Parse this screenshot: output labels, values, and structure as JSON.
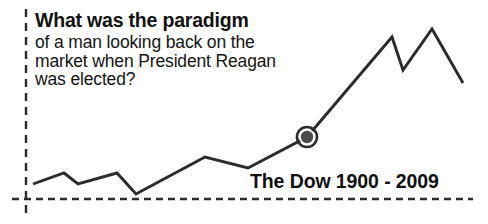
{
  "headline": "What was the paradigm",
  "body_lines": [
    "of a man looking back on the",
    "market when President Reagan",
    "was elected?"
  ],
  "caption": "The Dow 1900 - 2009",
  "colors": {
    "background": "#ffffff",
    "ink": "#2b2b2b",
    "text": "#111111",
    "marker_fill": "#4a4a4a",
    "marker_ring": "#2b2b2b",
    "marker_gap": "#ffffff",
    "axis": "#2b2b2b"
  },
  "chart_data": {
    "type": "line",
    "title": "The Dow 1900 - 2009",
    "xlabel": "",
    "ylabel": "",
    "grid": false,
    "legend": null,
    "axis_style": "dashed",
    "annotation": "What was the paradigm of a man looking back on the market when President Reagan was elected?",
    "x_axis_range_label": "1900 - 2009",
    "line_points": [
      {
        "x": 33,
        "y": 184
      },
      {
        "x": 64,
        "y": 173
      },
      {
        "x": 78,
        "y": 184
      },
      {
        "x": 117,
        "y": 173
      },
      {
        "x": 136,
        "y": 194
      },
      {
        "x": 205,
        "y": 157
      },
      {
        "x": 248,
        "y": 168
      },
      {
        "x": 307,
        "y": 137
      },
      {
        "x": 392,
        "y": 37
      },
      {
        "x": 403,
        "y": 70
      },
      {
        "x": 432,
        "y": 29
      },
      {
        "x": 463,
        "y": 83
      }
    ],
    "marker": {
      "label": "Reagan elected",
      "x": 307,
      "y": 137,
      "outer_radius": 10,
      "inner_radius": 6.2
    },
    "axes": {
      "vertical": {
        "x": 26,
        "y_top": 9,
        "y_bottom": 215
      },
      "horizontal": {
        "y": 199,
        "x_left": 12,
        "x_right": 473
      }
    },
    "dash_pattern": {
      "dash": 7,
      "gap": 5
    }
  }
}
